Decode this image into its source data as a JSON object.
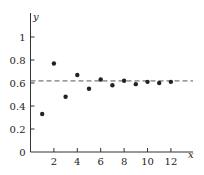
{
  "chart_data": {
    "type": "scatter",
    "title": "",
    "xlabel": "x",
    "ylabel": "y",
    "xlim": [
      0,
      14
    ],
    "ylim": [
      0,
      1.2
    ],
    "grid": false,
    "legend": null,
    "x_ticks": [
      2,
      4,
      6,
      8,
      10,
      12
    ],
    "x_tick_labels": [
      "2",
      "4",
      "6",
      "8",
      "10",
      "12"
    ],
    "y_ticks": [
      0,
      0.2,
      0.4,
      0.6,
      0.8,
      1
    ],
    "y_tick_labels": [
      "0",
      "0.2",
      "0.4",
      "0.6",
      "0.8",
      "1"
    ],
    "series": [
      {
        "name": "points",
        "x": [
          1,
          2,
          3,
          4,
          5,
          6,
          7,
          8,
          9,
          10,
          11,
          12
        ],
        "y": [
          0.33,
          0.77,
          0.48,
          0.67,
          0.55,
          0.63,
          0.58,
          0.62,
          0.59,
          0.61,
          0.6,
          0.61
        ]
      }
    ],
    "annotations": [
      {
        "type": "hline",
        "y": 0.618,
        "style": "dashed",
        "label": ""
      }
    ],
    "colors": {
      "points": "#222222",
      "axes": "#333333",
      "dashed_line": "#555555"
    }
  }
}
